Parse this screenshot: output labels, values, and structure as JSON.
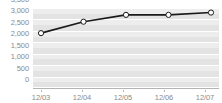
{
  "chart_data": {
    "type": "line",
    "title": "",
    "xlabel": "",
    "ylabel": "",
    "categories": [
      "12/03",
      "12/04",
      "12/05",
      "12/06",
      "12/07"
    ],
    "values": [
      2400,
      2900,
      3200,
      3200,
      3300
    ],
    "series": [
      {
        "name": "",
        "values": [
          2400,
          2900,
          3200,
          3200,
          3300
        ]
      }
    ],
    "ylim": [
      0,
      3500
    ],
    "ytick_labels": [
      "3,500",
      "3,000",
      "2,500",
      "2,000",
      "1,500",
      "1,000",
      "500",
      "0"
    ],
    "ytick_values": [
      3500,
      3000,
      2500,
      2000,
      1500,
      1000,
      500,
      0
    ],
    "grid": true,
    "legend": "none",
    "marker": "open-circle",
    "colors": {
      "line": "#1a1a1a",
      "marker_fill": "#ffffff",
      "marker_stroke": "#1a1a1a",
      "plot_background": "#e3e3e3",
      "band": "#ededed",
      "gridline": "#ffffff",
      "axis_line": "#b4b4b4",
      "tick_label": "#8a8a8a"
    }
  }
}
